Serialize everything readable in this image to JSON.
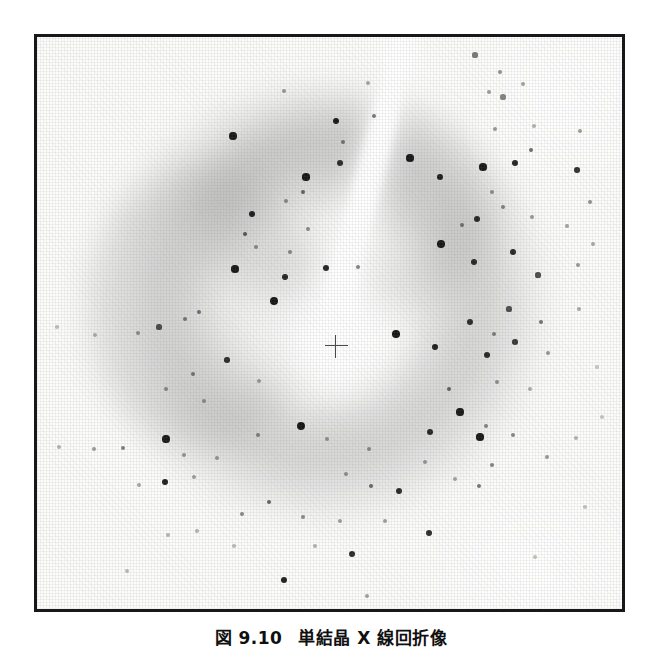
{
  "page": {
    "background_color": "#ffffff",
    "width": 662,
    "height": 649
  },
  "figure": {
    "caption_number": "図 9.10",
    "caption_title": "単結晶 X 線回折像",
    "caption_full": "図 9.10　単結晶 X 線回折像",
    "frame": {
      "border_color": "#17181a",
      "border_width_px": 3,
      "x": 34,
      "y": 34,
      "width": 591,
      "height": 578
    },
    "plate_background_color": "#fbfbfa",
    "spot_color": "#101010"
  },
  "chart_data": {
    "type": "scatter",
    "title": "単結晶 X 線回折像",
    "subtitle": "",
    "xlabel": "",
    "ylabel": "",
    "xlim": [
      0,
      585
    ],
    "ylim": [
      0,
      572
    ],
    "grid": false,
    "legend_position": "none",
    "beam_center": {
      "x": 299,
      "y": 309,
      "marker": "crosshair",
      "size_px": 23
    },
    "halo": {
      "center_x": 285,
      "center_y": 265,
      "inner_radius": 80,
      "outer_radius": 235,
      "peak_gray": "#8a8a8a"
    },
    "beam_streak": {
      "color": "#ffffff",
      "path": [
        {
          "x": 366,
          "y": 0,
          "w": 15
        },
        {
          "x": 356,
          "y": 45,
          "w": 16
        },
        {
          "x": 344,
          "y": 95,
          "w": 17
        },
        {
          "x": 330,
          "y": 150,
          "w": 18
        },
        {
          "x": 316,
          "y": 200,
          "w": 19
        },
        {
          "x": 305,
          "y": 250,
          "w": 21
        },
        {
          "x": 299,
          "y": 295,
          "w": 26
        },
        {
          "x": 297,
          "y": 320,
          "w": 30
        }
      ]
    },
    "series": [
      {
        "name": "strong reflections",
        "marker": "filled-circle",
        "color": "#0d0d0d",
        "points": [
          {
            "x": 247,
            "y": 54,
            "r": 2.2,
            "o": 0.4
          },
          {
            "x": 331,
            "y": 46,
            "r": 2.0,
            "o": 0.35
          },
          {
            "x": 438,
            "y": 18,
            "r": 2.6,
            "o": 0.55
          },
          {
            "x": 463,
            "y": 35,
            "r": 2.2,
            "o": 0.45
          },
          {
            "x": 466,
            "y": 60,
            "r": 2.6,
            "o": 0.5
          },
          {
            "x": 196,
            "y": 99,
            "r": 3.6,
            "o": 0.95
          },
          {
            "x": 299,
            "y": 84,
            "r": 3.4,
            "o": 0.95
          },
          {
            "x": 306,
            "y": 105,
            "r": 2.2,
            "o": 0.5
          },
          {
            "x": 337,
            "y": 79,
            "r": 2.4,
            "o": 0.55
          },
          {
            "x": 452,
            "y": 55,
            "r": 2.2,
            "o": 0.4
          },
          {
            "x": 458,
            "y": 92,
            "r": 2.2,
            "o": 0.42
          },
          {
            "x": 486,
            "y": 47,
            "r": 2.1,
            "o": 0.38
          },
          {
            "x": 497,
            "y": 89,
            "r": 2.0,
            "o": 0.32
          },
          {
            "x": 373,
            "y": 121,
            "r": 3.6,
            "o": 0.95
          },
          {
            "x": 403,
            "y": 140,
            "r": 3.4,
            "o": 0.92
          },
          {
            "x": 269,
            "y": 140,
            "r": 3.6,
            "o": 0.95
          },
          {
            "x": 303,
            "y": 126,
            "r": 3.0,
            "o": 0.85
          },
          {
            "x": 249,
            "y": 164,
            "r": 2.1,
            "o": 0.42
          },
          {
            "x": 215,
            "y": 177,
            "r": 3.4,
            "o": 0.92
          },
          {
            "x": 266,
            "y": 155,
            "r": 2.4,
            "o": 0.6
          },
          {
            "x": 446,
            "y": 130,
            "r": 3.6,
            "o": 0.95
          },
          {
            "x": 478,
            "y": 126,
            "r": 3.2,
            "o": 0.9
          },
          {
            "x": 494,
            "y": 113,
            "r": 2.4,
            "o": 0.6
          },
          {
            "x": 540,
            "y": 133,
            "r": 2.8,
            "o": 0.85
          },
          {
            "x": 543,
            "y": 94,
            "r": 2.1,
            "o": 0.4
          },
          {
            "x": 553,
            "y": 165,
            "r": 2.2,
            "o": 0.45
          },
          {
            "x": 208,
            "y": 197,
            "r": 2.4,
            "o": 0.65
          },
          {
            "x": 219,
            "y": 210,
            "r": 2.0,
            "o": 0.42
          },
          {
            "x": 271,
            "y": 192,
            "r": 2.1,
            "o": 0.45
          },
          {
            "x": 455,
            "y": 155,
            "r": 2.1,
            "o": 0.42
          },
          {
            "x": 440,
            "y": 182,
            "r": 3.0,
            "o": 0.88
          },
          {
            "x": 466,
            "y": 170,
            "r": 2.2,
            "o": 0.48
          },
          {
            "x": 495,
            "y": 180,
            "r": 2.0,
            "o": 0.4
          },
          {
            "x": 530,
            "y": 189,
            "r": 2.0,
            "o": 0.38
          },
          {
            "x": 404,
            "y": 207,
            "r": 3.8,
            "o": 0.95
          },
          {
            "x": 425,
            "y": 188,
            "r": 2.2,
            "o": 0.5
          },
          {
            "x": 198,
            "y": 232,
            "r": 3.6,
            "o": 0.95
          },
          {
            "x": 253,
            "y": 215,
            "r": 2.0,
            "o": 0.45
          },
          {
            "x": 248,
            "y": 240,
            "r": 3.2,
            "o": 0.9
          },
          {
            "x": 289,
            "y": 231,
            "r": 3.2,
            "o": 0.9
          },
          {
            "x": 321,
            "y": 230,
            "r": 2.2,
            "o": 0.5
          },
          {
            "x": 437,
            "y": 225,
            "r": 3.0,
            "o": 0.88
          },
          {
            "x": 476,
            "y": 215,
            "r": 3.0,
            "o": 0.88
          },
          {
            "x": 501,
            "y": 238,
            "r": 2.6,
            "o": 0.72
          },
          {
            "x": 541,
            "y": 228,
            "r": 2.1,
            "o": 0.42
          },
          {
            "x": 556,
            "y": 207,
            "r": 2.0,
            "o": 0.35
          },
          {
            "x": 237,
            "y": 264,
            "r": 4.2,
            "o": 0.96
          },
          {
            "x": 162,
            "y": 275,
            "r": 2.2,
            "o": 0.55
          },
          {
            "x": 122,
            "y": 290,
            "r": 2.6,
            "o": 0.7
          },
          {
            "x": 148,
            "y": 282,
            "r": 2.2,
            "o": 0.5
          },
          {
            "x": 101,
            "y": 296,
            "r": 2.0,
            "o": 0.4
          },
          {
            "x": 58,
            "y": 298,
            "r": 1.9,
            "o": 0.3
          },
          {
            "x": 20,
            "y": 290,
            "r": 1.8,
            "o": 0.26
          },
          {
            "x": 472,
            "y": 272,
            "r": 2.6,
            "o": 0.7
          },
          {
            "x": 433,
            "y": 285,
            "r": 3.0,
            "o": 0.85
          },
          {
            "x": 457,
            "y": 297,
            "r": 2.2,
            "o": 0.48
          },
          {
            "x": 504,
            "y": 285,
            "r": 2.4,
            "o": 0.56
          },
          {
            "x": 542,
            "y": 272,
            "r": 2.0,
            "o": 0.35
          },
          {
            "x": 359,
            "y": 297,
            "r": 3.8,
            "o": 0.96
          },
          {
            "x": 398,
            "y": 310,
            "r": 3.4,
            "o": 0.92
          },
          {
            "x": 450,
            "y": 318,
            "r": 3.0,
            "o": 0.88
          },
          {
            "x": 478,
            "y": 305,
            "r": 2.8,
            "o": 0.8
          },
          {
            "x": 511,
            "y": 316,
            "r": 2.1,
            "o": 0.42
          },
          {
            "x": 190,
            "y": 323,
            "r": 2.8,
            "o": 0.85
          },
          {
            "x": 156,
            "y": 337,
            "r": 2.2,
            "o": 0.5
          },
          {
            "x": 129,
            "y": 352,
            "r": 2.0,
            "o": 0.42
          },
          {
            "x": 167,
            "y": 364,
            "r": 2.0,
            "o": 0.38
          },
          {
            "x": 222,
            "y": 344,
            "r": 2.0,
            "o": 0.36
          },
          {
            "x": 460,
            "y": 345,
            "r": 2.1,
            "o": 0.42
          },
          {
            "x": 412,
            "y": 352,
            "r": 2.4,
            "o": 0.6
          },
          {
            "x": 493,
            "y": 352,
            "r": 1.9,
            "o": 0.32
          },
          {
            "x": 423,
            "y": 375,
            "r": 3.6,
            "o": 0.95
          },
          {
            "x": 449,
            "y": 389,
            "r": 2.2,
            "o": 0.48
          },
          {
            "x": 393,
            "y": 395,
            "r": 3.0,
            "o": 0.88
          },
          {
            "x": 264,
            "y": 389,
            "r": 4.0,
            "o": 0.96
          },
          {
            "x": 221,
            "y": 398,
            "r": 2.1,
            "o": 0.45
          },
          {
            "x": 290,
            "y": 402,
            "r": 2.0,
            "o": 0.38
          },
          {
            "x": 129,
            "y": 402,
            "r": 3.6,
            "o": 0.95
          },
          {
            "x": 86,
            "y": 411,
            "r": 2.2,
            "o": 0.52
          },
          {
            "x": 57,
            "y": 412,
            "r": 2.0,
            "o": 0.4
          },
          {
            "x": 22,
            "y": 410,
            "r": 1.9,
            "o": 0.3
          },
          {
            "x": 443,
            "y": 400,
            "r": 3.6,
            "o": 0.95
          },
          {
            "x": 476,
            "y": 398,
            "r": 2.2,
            "o": 0.48
          },
          {
            "x": 539,
            "y": 401,
            "r": 1.9,
            "o": 0.3
          },
          {
            "x": 147,
            "y": 418,
            "r": 2.0,
            "o": 0.4
          },
          {
            "x": 180,
            "y": 421,
            "r": 2.0,
            "o": 0.38
          },
          {
            "x": 332,
            "y": 412,
            "r": 2.1,
            "o": 0.42
          },
          {
            "x": 388,
            "y": 425,
            "r": 2.0,
            "o": 0.38
          },
          {
            "x": 309,
            "y": 437,
            "r": 2.0,
            "o": 0.4
          },
          {
            "x": 128,
            "y": 445,
            "r": 3.4,
            "o": 0.93
          },
          {
            "x": 157,
            "y": 440,
            "r": 2.0,
            "o": 0.38
          },
          {
            "x": 102,
            "y": 448,
            "r": 2.0,
            "o": 0.36
          },
          {
            "x": 455,
            "y": 428,
            "r": 2.2,
            "o": 0.5
          },
          {
            "x": 510,
            "y": 420,
            "r": 2.1,
            "o": 0.42
          },
          {
            "x": 442,
            "y": 449,
            "r": 2.4,
            "o": 0.56
          },
          {
            "x": 418,
            "y": 442,
            "r": 2.0,
            "o": 0.36
          },
          {
            "x": 362,
            "y": 454,
            "r": 3.0,
            "o": 0.88
          },
          {
            "x": 334,
            "y": 449,
            "r": 2.4,
            "o": 0.6
          },
          {
            "x": 232,
            "y": 465,
            "r": 2.4,
            "o": 0.62
          },
          {
            "x": 205,
            "y": 477,
            "r": 2.2,
            "o": 0.48
          },
          {
            "x": 266,
            "y": 480,
            "r": 2.2,
            "o": 0.46
          },
          {
            "x": 303,
            "y": 484,
            "r": 2.0,
            "o": 0.38
          },
          {
            "x": 348,
            "y": 484,
            "r": 2.0,
            "o": 0.38
          },
          {
            "x": 392,
            "y": 496,
            "r": 3.0,
            "o": 0.88
          },
          {
            "x": 131,
            "y": 498,
            "r": 1.9,
            "o": 0.3
          },
          {
            "x": 160,
            "y": 494,
            "r": 1.9,
            "o": 0.3
          },
          {
            "x": 197,
            "y": 509,
            "r": 1.9,
            "o": 0.28
          },
          {
            "x": 278,
            "y": 509,
            "r": 1.9,
            "o": 0.3
          },
          {
            "x": 315,
            "y": 517,
            "r": 3.0,
            "o": 0.88
          },
          {
            "x": 247,
            "y": 543,
            "r": 3.4,
            "o": 0.93
          },
          {
            "x": 90,
            "y": 534,
            "r": 1.9,
            "o": 0.28
          },
          {
            "x": 330,
            "y": 559,
            "r": 2.0,
            "o": 0.38
          },
          {
            "x": 498,
            "y": 520,
            "r": 1.8,
            "o": 0.24
          },
          {
            "x": 548,
            "y": 470,
            "r": 1.8,
            "o": 0.24
          },
          {
            "x": 565,
            "y": 380,
            "r": 1.8,
            "o": 0.22
          },
          {
            "x": 560,
            "y": 330,
            "r": 1.8,
            "o": 0.22
          }
        ]
      }
    ]
  }
}
